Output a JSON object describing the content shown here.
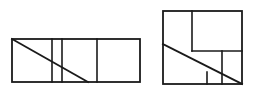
{
  "scene": {
    "title": "Two dissected rectangle diagrams",
    "background_color": "#ffffff",
    "stroke_color": "#1a1a1a",
    "canvas": {
      "width": 253,
      "height": 95
    }
  },
  "figures": [
    {
      "id": "left-figure",
      "name": "wide-rectangle-with-diagonal",
      "label": "",
      "outline": {
        "x": 12,
        "y": 39,
        "width": 128,
        "height": 43
      },
      "vertical_dividers": [
        52,
        62,
        97
      ],
      "horizontal_dividers": [],
      "diagonals": [
        {
          "x1": 12,
          "y1": 39,
          "x2": 88,
          "y2": 82
        }
      ]
    },
    {
      "id": "right-figure",
      "name": "square-with-diagonal",
      "label": "",
      "outline": {
        "x": 163,
        "y": 11,
        "width": 79,
        "height": 73
      },
      "vertical_dividers": [
        192,
        222,
        207
      ],
      "horizontal_dividers": [
        51
      ],
      "diagonals": [
        {
          "x1": 163,
          "y1": 44,
          "x2": 242,
          "y2": 84
        }
      ]
    }
  ],
  "chart_data": {
    "type": "diagram",
    "xlabel": "",
    "ylabel": "",
    "shapes": [
      {
        "shape": "rectangle",
        "figure": "left",
        "x": 12,
        "y": 39,
        "width": 128,
        "height": 43,
        "subdivisions": 4,
        "cut_lines": [
          "vertical x=52",
          "vertical x=62",
          "vertical x=97",
          "diagonal (12,39)-(88,82)"
        ]
      },
      {
        "shape": "rectangle",
        "figure": "right",
        "x": 163,
        "y": 11,
        "width": 79,
        "height": 73,
        "subdivisions": 6,
        "cut_lines": [
          "vertical x=192 from y=11 to y=51",
          "horizontal y=51 from x=192 to x=242",
          "vertical x=222 from y=51 to y=84",
          "vertical x=207 from y=72 to y=84",
          "diagonal (163,44)-(242,84)"
        ]
      }
    ]
  }
}
